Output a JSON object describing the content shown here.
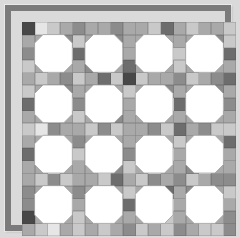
{
  "scene": {
    "description": "Snowball patchwork quilt design: 4x4 white octagon blocks set in a 17x17 grid of gray-toned squares inside a dark gray frame on a light gray background",
    "background_color": "#dadada"
  },
  "frame": {
    "color": "#7b7b7b",
    "thickness_px": 6
  },
  "palette": {
    "W": "#ffffff",
    "A": "#e6e6e6",
    "B": "#c9c9c9",
    "C": "#a9a9a9",
    "D": "#8c8c8c",
    "E": "#6d6d6d",
    "F": "#484848"
  },
  "grid": {
    "rows": 17,
    "cols": 17,
    "origin_px": [
      11,
      11
    ],
    "size_px": 214,
    "gridline_color": "#8f8f8f",
    "cell_colors": [
      "FABCDCCDCCBECBCCB",
      "CCWDBCWDCCWCCCWDB",
      "DWWWEWWWCWWWBWWWE",
      "BCWCCDWCECWCBCWCC",
      "CBCDBCEBFBCCDBCDE",
      "BCWDCCWCBCWDCCWDC",
      "EWWWDWWWCWWWEWWWD",
      "CCWCBCWDCCWCCCWCC",
      "BADCCBDBCCDBECDBB",
      "CCWCDCWCCCWCBCWCE",
      "EWWWBWWWDWWWCWWWC",
      "CCWCCCWDBCWCCDWCC",
      "CBDBCCBECBDCDBCDD",
      "DCWCDCWCBCWECDWCB",
      "DWWWCWWWEWWWCWWWC",
      "FCWCBCWCCCWBCCWCD",
      "CBACBCBCDBCBDCBBD"
    ]
  },
  "octagons": {
    "count": 16,
    "fill": "#ffffff",
    "outline_color": "#9e9e9e",
    "block_size_cells": 3,
    "corner_cut_px": 8.5,
    "block_origin_cells": [
      [
        2,
        2
      ],
      [
        2,
        6
      ],
      [
        2,
        10
      ],
      [
        2,
        14
      ],
      [
        6,
        2
      ],
      [
        6,
        6
      ],
      [
        6,
        10
      ],
      [
        6,
        14
      ],
      [
        10,
        2
      ],
      [
        10,
        6
      ],
      [
        10,
        10
      ],
      [
        10,
        14
      ],
      [
        14,
        2
      ],
      [
        14,
        6
      ],
      [
        14,
        10
      ],
      [
        14,
        14
      ]
    ]
  }
}
